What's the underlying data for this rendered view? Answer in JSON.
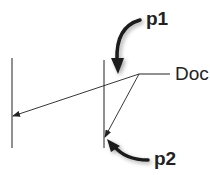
{
  "diagram": {
    "labels": {
      "p1": "p1",
      "p2": "p2",
      "doc": "Doc"
    },
    "colors": {
      "line": "#222222",
      "pointer": "#1a1a1a"
    },
    "elements": {
      "left_line": {
        "x": 12,
        "y1": 58,
        "y2": 148
      },
      "middle_line": {
        "x": 104,
        "y1": 60,
        "y2": 148
      },
      "origin_point": {
        "x": 139,
        "y": 74
      },
      "doc_leader": {
        "x1": 139,
        "x2": 170,
        "y": 74
      },
      "ray_to_left": {
        "from": [
          139,
          74
        ],
        "to": [
          12,
          116
        ]
      },
      "ray_to_middle": {
        "from": [
          139,
          74
        ],
        "to": [
          105,
          137
        ]
      }
    }
  }
}
